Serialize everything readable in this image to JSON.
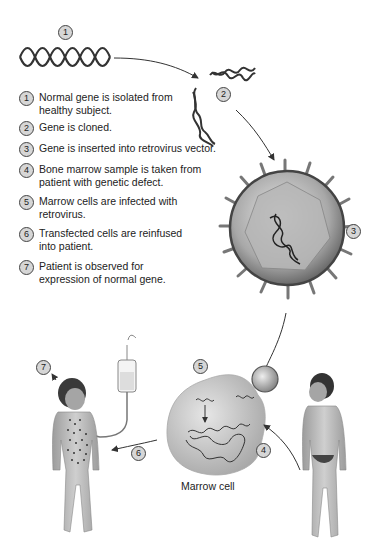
{
  "diagram": {
    "steps": [
      {
        "num": "1",
        "text": "Normal gene is isolated from healthy subject."
      },
      {
        "num": "2",
        "text": "Gene is cloned."
      },
      {
        "num": "3",
        "text": "Gene is inserted into retrovirus vector."
      },
      {
        "num": "4",
        "text": "Bone marrow sample is taken from patient with genetic defect."
      },
      {
        "num": "5",
        "text": "Marrow cells are infected with retrovirus."
      },
      {
        "num": "6",
        "text": "Transfected cells are reinfused into patient."
      },
      {
        "num": "7",
        "text": "Patient is observed for expression of normal gene."
      }
    ],
    "markers": {
      "m1": "1",
      "m2": "2",
      "m3": "3",
      "m4": "4",
      "m5": "5",
      "m6": "6",
      "m7": "7"
    },
    "labels": {
      "marrow_cell": "Marrow cell"
    },
    "colors": {
      "line": "#333333",
      "marker_fill": "#d6d6d6",
      "virus_fill": "#9a9a9a",
      "cell_fill": "#c8c8c8",
      "skin": "#b5b5b5"
    }
  }
}
